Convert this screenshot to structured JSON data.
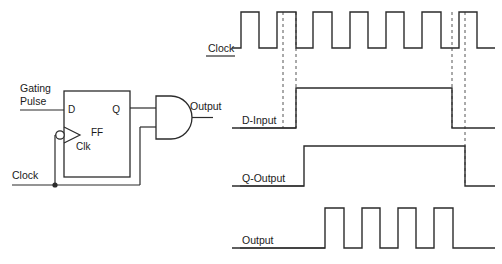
{
  "figure": {
    "type": "digital-timing-and-circuit",
    "background": "#ffffff",
    "line_color": "#2b2b2b",
    "dash_color": "#555555"
  },
  "circuit": {
    "title_pins": {
      "d_pin": "D",
      "q_pin": "Q",
      "clk_pin": "Clk",
      "block_label": "FF"
    },
    "inputs": [
      {
        "name": "gating-pulse",
        "line1": "Gating",
        "line2": "Pulse"
      },
      {
        "name": "clock",
        "label": "Clock"
      }
    ],
    "outputs": [
      {
        "name": "and-gate-output",
        "label": "Output"
      }
    ],
    "gate": {
      "kind": "AND",
      "inputs": 2
    },
    "inverter_bubble": true,
    "junction_dot": true
  },
  "timing": {
    "rows": [
      {
        "name": "clock",
        "label": "Clock"
      },
      {
        "name": "d-input",
        "label": "D-Input"
      },
      {
        "name": "q-output",
        "label": "Q-Output"
      },
      {
        "name": "output",
        "label": "Output"
      }
    ],
    "markers": [
      {
        "name": "marker-1",
        "x": 283
      },
      {
        "name": "marker-2",
        "x": 296
      },
      {
        "name": "marker-3",
        "x": 452
      },
      {
        "name": "marker-4",
        "x": 465
      }
    ]
  },
  "chart_data": {
    "type": "line",
    "title": "",
    "xlabel": "",
    "ylabel": "",
    "x_range": [
      232,
      495
    ],
    "signals": [
      {
        "name": "Clock",
        "row_label": "Clock",
        "baseline_y": 48,
        "top_y": 12,
        "kind": "square-wave",
        "pulses": [
          {
            "rise": 241,
            "fall": 259
          },
          {
            "rise": 277,
            "fall": 296
          },
          {
            "rise": 313,
            "fall": 332
          },
          {
            "rise": 350,
            "fall": 368
          },
          {
            "rise": 386,
            "fall": 404
          },
          {
            "rise": 422,
            "fall": 441
          },
          {
            "rise": 459,
            "fall": 477
          }
        ],
        "start_x": 232,
        "end_x": 495,
        "initial_level": 0,
        "final_level": 0
      },
      {
        "name": "D-Input",
        "row_label": "D-Input",
        "baseline_y": 128,
        "top_y": 88,
        "kind": "single-pulse",
        "pulses": [
          {
            "rise": 296,
            "fall": 452
          }
        ],
        "start_x": 232,
        "end_x": 495,
        "initial_level": 0,
        "final_level": 0
      },
      {
        "name": "Q-Output",
        "row_label": "Q-Output",
        "baseline_y": 186,
        "top_y": 146,
        "kind": "single-pulse",
        "pulses": [
          {
            "rise": 304,
            "fall": 465
          }
        ],
        "start_x": 232,
        "end_x": 495,
        "initial_level": 0,
        "final_level": 0
      },
      {
        "name": "Output",
        "row_label": "Output",
        "baseline_y": 248,
        "top_y": 208,
        "kind": "square-wave",
        "pulses": [
          {
            "rise": 325,
            "fall": 344
          },
          {
            "rise": 362,
            "fall": 380
          },
          {
            "rise": 398,
            "fall": 416
          },
          {
            "rise": 434,
            "fall": 453
          }
        ],
        "start_x": 232,
        "end_x": 495,
        "initial_level": 0,
        "final_level": 0
      }
    ]
  }
}
